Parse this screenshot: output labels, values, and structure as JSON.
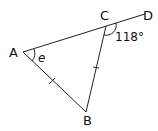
{
  "diagram": {
    "points": {
      "A": {
        "label": "A",
        "x": 23,
        "y": 52
      },
      "B": {
        "label": "B",
        "x": 86,
        "y": 112
      },
      "C": {
        "label": "C",
        "x": 106,
        "y": 26
      },
      "D": {
        "label": "D",
        "x": 145,
        "y": 14
      }
    },
    "angle_at_A": {
      "label": "e"
    },
    "exterior_angle_at_C": {
      "label": "118°"
    },
    "equal_sides": [
      "AB",
      "CB"
    ],
    "colors": {
      "stroke": "#222222",
      "text": "#111111"
    }
  }
}
